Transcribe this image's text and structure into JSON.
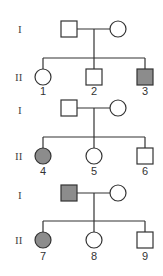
{
  "diagram": {
    "type": "pedigree",
    "affected_color": "#8c8c8c",
    "unaffected_color": "#ffffff",
    "stroke_color": "#333333",
    "pedigrees": [
      {
        "generation_labels": [
          "I",
          "II"
        ],
        "parents": [
          {
            "sex": "male",
            "affected": false
          },
          {
            "sex": "female",
            "affected": false
          }
        ],
        "children": [
          {
            "id": "1",
            "sex": "female",
            "affected": false
          },
          {
            "id": "2",
            "sex": "male",
            "affected": false
          },
          {
            "id": "3",
            "sex": "male",
            "affected": true
          }
        ]
      },
      {
        "generation_labels": [
          "I",
          "II"
        ],
        "parents": [
          {
            "sex": "male",
            "affected": false
          },
          {
            "sex": "female",
            "affected": false
          }
        ],
        "children": [
          {
            "id": "4",
            "sex": "female",
            "affected": true
          },
          {
            "id": "5",
            "sex": "female",
            "affected": false
          },
          {
            "id": "6",
            "sex": "male",
            "affected": false
          }
        ]
      },
      {
        "generation_labels": [
          "I",
          "II"
        ],
        "parents": [
          {
            "sex": "male",
            "affected": true
          },
          {
            "sex": "female",
            "affected": false
          }
        ],
        "children": [
          {
            "id": "7",
            "sex": "female",
            "affected": true
          },
          {
            "id": "8",
            "sex": "female",
            "affected": false
          },
          {
            "id": "9",
            "sex": "male",
            "affected": false
          }
        ]
      }
    ]
  }
}
